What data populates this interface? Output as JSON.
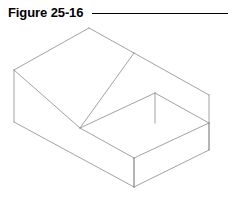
{
  "header": {
    "figure_label": "Figure 25-16",
    "rule_color": "#000000"
  },
  "drawing": {
    "name": "isometric-stepped-block",
    "line_color": "#8a8a8a",
    "fill_color": "#ffffff",
    "description": "Isometric pictorial of a rectangular block with a rectangular step cut at the front right",
    "vertices": {
      "top_apex": [
        89,
        6
      ],
      "top_left": [
        14,
        48
      ],
      "top_mid_right": [
        134,
        31
      ],
      "top_right": [
        209,
        73
      ],
      "front_left_bottom": [
        14,
        100
      ],
      "front_bottom": [
        134,
        165
      ],
      "right_bottom": [
        209,
        128
      ],
      "step_top_inner": [
        155,
        71
      ],
      "step_left_inner": [
        80,
        106
      ],
      "step_front_inner": [
        134,
        136
      ],
      "step_right_inner": [
        209,
        101
      ]
    }
  }
}
